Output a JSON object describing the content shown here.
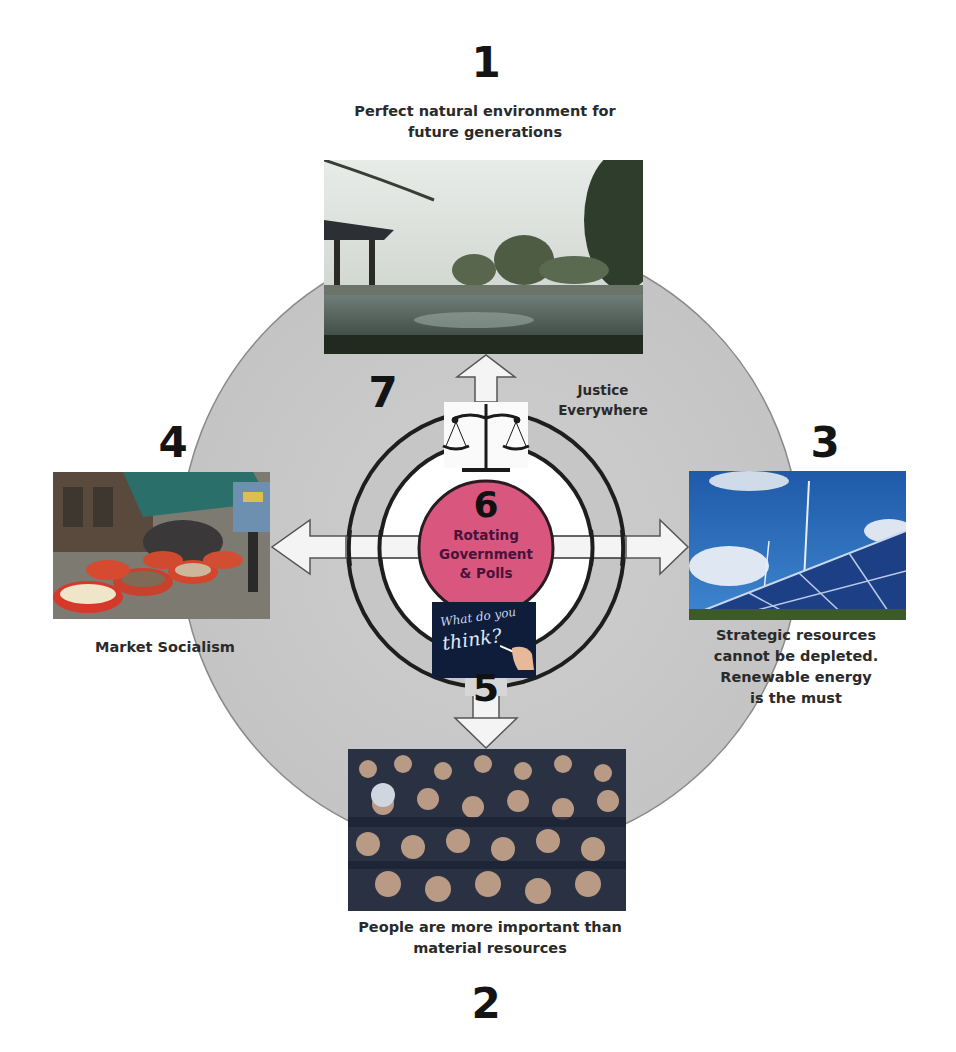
{
  "diagram": {
    "center_circle": {
      "number": "6",
      "label_lines": [
        "Rotating",
        "Government",
        "& Polls"
      ],
      "fill": "#d9577f"
    },
    "chalkboard": {
      "line1": "What do you",
      "line2": "think?",
      "number": "5"
    },
    "justice": {
      "number": "7",
      "label_lines": [
        "Justice",
        "Everywhere"
      ],
      "icon": "scales-of-justice"
    },
    "nodes": [
      {
        "id": "1",
        "number": "1",
        "caption_lines": [
          "Perfect natural environment for",
          "future generations"
        ],
        "image": "garden-pond-photo",
        "position": "top"
      },
      {
        "id": "2",
        "number": "2",
        "caption_lines": [
          "People are more important than",
          "material resources"
        ],
        "image": "crowd-photo",
        "position": "bottom"
      },
      {
        "id": "3",
        "number": "3",
        "caption_lines": [
          "Strategic resources",
          "cannot be depleted.",
          "Renewable energy",
          "is the must"
        ],
        "image": "solar-wind-photo",
        "position": "right"
      },
      {
        "id": "4",
        "number": "4",
        "caption_lines": [
          "Market Socialism"
        ],
        "image": "market-photo",
        "position": "left"
      }
    ],
    "colors": {
      "big_circle": "#c9c9c9",
      "big_circle_stroke": "#8a8a8a",
      "ring_stroke": "#1e1e1e",
      "inner_white": "#ffffff",
      "arrow_fill": "#f4f4f4"
    }
  }
}
